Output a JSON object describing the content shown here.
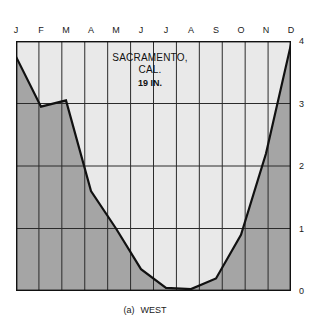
{
  "figure": {
    "caption_tag": "(a)",
    "caption_text": "WEST"
  },
  "colors": {
    "below_curve_fill": "#a5a5a5",
    "above_curve_fill": "#e9e9e9",
    "curve_stroke": "#111111",
    "grid_stroke": "#2b2b2b",
    "frame_stroke": "#111111",
    "text": "#1a1a1a",
    "background": "#ffffff"
  },
  "chart_data": {
    "type": "area",
    "title": "SACRAMENTO, CAL.",
    "annotation": "19 IN.",
    "title_lines": [
      "SACRAMENTO,",
      "CAL.",
      "19 IN."
    ],
    "xlabel": "",
    "ylabel": "",
    "categories": [
      "J",
      "F",
      "M",
      "A",
      "M",
      "J",
      "J",
      "A",
      "S",
      "O",
      "N",
      "D"
    ],
    "category_names": [
      "January",
      "February",
      "March",
      "April",
      "May",
      "June",
      "July",
      "August",
      "September",
      "October",
      "November",
      "December"
    ],
    "values": [
      3.75,
      2.95,
      3.05,
      1.6,
      1.0,
      0.35,
      0.05,
      0.03,
      0.2,
      0.9,
      2.2,
      3.95
    ],
    "ylim": [
      0,
      4
    ],
    "yticks": [
      0,
      1,
      2,
      3,
      4
    ],
    "ytick_labels": [
      "0",
      "1",
      "2",
      "3",
      "4"
    ],
    "grid": true,
    "grid_vertical": true,
    "grid_horizontal": true,
    "legend": false,
    "units": "inches of precipitation"
  }
}
